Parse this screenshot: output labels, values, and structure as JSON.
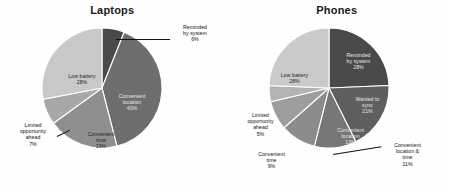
{
  "chart_data": [
    {
      "type": "pie",
      "title": "Laptops",
      "xlabel": "",
      "ylabel": "",
      "legend_position": "none",
      "grid": false,
      "categories": [
        "Reminded by system",
        "Convenient location",
        "Convenient time",
        "Limited opportunity ahead",
        "Low battery"
      ],
      "values": [
        6,
        40,
        19,
        7,
        28
      ],
      "labels": [
        "Reminded\nby system\n6%",
        "Convenient\nlocation\n40%",
        "Convenient\ntime\n19%",
        "Limited\nopportunity\nahead\n7%",
        "Low battery\n28%"
      ],
      "colors": [
        "#4a4a4a",
        "#6e6e6e",
        "#8f8f8f",
        "#a8a8a8",
        "#c9c9c9"
      ]
    },
    {
      "type": "pie",
      "title": "Phones",
      "xlabel": "",
      "ylabel": "",
      "legend_position": "none",
      "grid": false,
      "categories": [
        "Reminded by system",
        "Wanted to sync",
        "Convenient location",
        "Convenient location & time",
        "Convenient time",
        "Limited opportunity ahead",
        "Low battery"
      ],
      "values": [
        28,
        21,
        13,
        11,
        9,
        5,
        28
      ],
      "labels": [
        "Reminded\nby system\n28%",
        "Wanted to\nsync\n21%",
        "Convenient\nlocation\n13%",
        "Convenient\nlocation &\ntime\n11%",
        "Convenient\ntime\n9%",
        "Limited\nopportunity\nahead\n5%",
        "Low battery\n28%"
      ],
      "colors": [
        "#4a4a4a",
        "#5f5f5f",
        "#777777",
        "#8c8c8c",
        "#9e9e9e",
        "#b4b4b4",
        "#cbcbcb"
      ]
    }
  ],
  "laptops": {
    "title": "Laptops",
    "labels": {
      "reminded": "Reminded\nby system\n6%",
      "reminded_l1": "Reminded",
      "reminded_l2": "by system",
      "reminded_l3": "6%",
      "location_l1": "Convenient",
      "location_l2": "location",
      "location_l3": "40%",
      "time_l1": "Convenient",
      "time_l2": "time",
      "time_l3": "19%",
      "limited_l1": "Limited",
      "limited_l2": "opportunity",
      "limited_l3": "ahead",
      "limited_l4": "7%",
      "battery_l1": "Low battery",
      "battery_l2": "28%"
    }
  },
  "phones": {
    "title": "Phones",
    "labels": {
      "reminded_l1": "Reminded",
      "reminded_l2": "by system",
      "reminded_l3": "28%",
      "sync_l1": "Wanted to",
      "sync_l2": "sync",
      "sync_l3": "21%",
      "location_l1": "Convenient",
      "location_l2": "location",
      "location_l3": "13%",
      "loctime_l1": "Convenient",
      "loctime_l2": "location &",
      "loctime_l3": "time",
      "loctime_l4": "11%",
      "time_l1": "Convenient",
      "time_l2": "time",
      "time_l3": "9%",
      "limited_l1": "Limited",
      "limited_l2": "opportunity",
      "limited_l3": "ahead",
      "limited_l4": "5%",
      "battery_l1": "Low battery",
      "battery_l2": "28%"
    }
  }
}
